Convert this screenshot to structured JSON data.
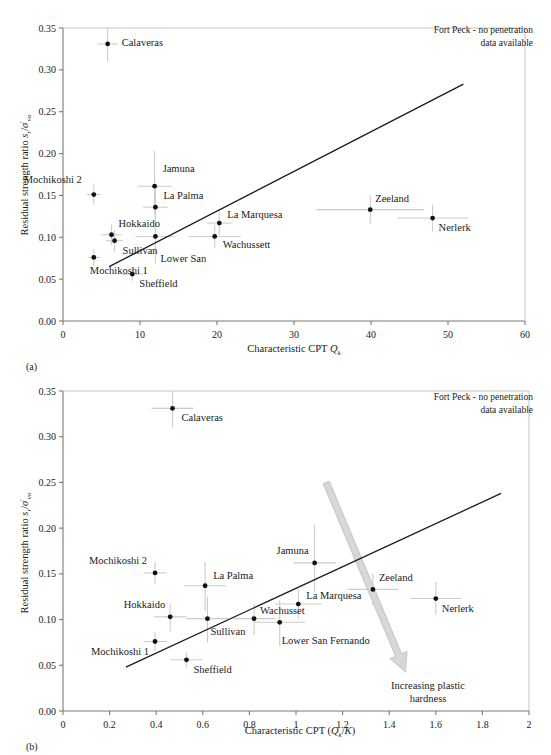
{
  "figure": {
    "panel_a_tag": "(a)",
    "panel_b_tag": "(b)",
    "note_line1": "Fort Peck - no penetration",
    "note_line2": "data available",
    "arrow_note_line1": "Increasing plastic",
    "arrow_note_line2": "hardness",
    "line_color": "#1a1a1a",
    "point_color": "#111111",
    "errorbar_color": "#cccccc",
    "axis_color": "#7a7a7a",
    "arrow_color": "#d8d8d8"
  },
  "chart_data": [
    {
      "type": "scatter",
      "panel": "(a)",
      "title": "",
      "xlabel": "Characteristic CPT Q_k",
      "xlabel_main": "Characteristic CPT ",
      "xlabel_sym": "Q",
      "xlabel_sub": "k",
      "ylabel": "Residual strength ratio s_r/σ'_vo",
      "ylabel_pre": "Residual strength ratio ",
      "ylabel_s": "s",
      "ylabel_s_sub": "r",
      "ylabel_slash": "/",
      "ylabel_sigma": "σ",
      "ylabel_sigma_sub": "vo",
      "xlim": [
        0,
        60
      ],
      "ylim": [
        0.0,
        0.35
      ],
      "xticks": [
        "0",
        "10",
        "20",
        "30",
        "40",
        "50",
        "60"
      ],
      "xtick_values": [
        0,
        10,
        20,
        30,
        40,
        50,
        60
      ],
      "yticks": [
        "0.00",
        "0.05",
        "0.10",
        "0.15",
        "0.20",
        "0.25",
        "0.30",
        "0.35"
      ],
      "ytick_values": [
        0.0,
        0.05,
        0.1,
        0.15,
        0.2,
        0.25,
        0.3,
        0.35
      ],
      "grid": false,
      "legend": "none",
      "fit_line": {
        "x1": 6.0,
        "y1": 0.065,
        "x2": 52.0,
        "y2": 0.283
      },
      "points": [
        {
          "name": "Calaveras",
          "x": 5.8,
          "y": 0.331,
          "xerr_lo": 1.3,
          "xerr_hi": 1.3,
          "yerr_lo": 0.021,
          "yerr_hi": 0.019,
          "label_dx": 14,
          "label_dy": 2
        },
        {
          "name": "Mochikoshi 2",
          "x": 4.0,
          "y": 0.151,
          "xerr_lo": 0.9,
          "xerr_hi": 0.9,
          "yerr_lo": 0.012,
          "yerr_hi": 0.012,
          "label_dx": -12,
          "label_dy": -12,
          "anchor": "end"
        },
        {
          "name": "Jamuna",
          "x": 11.9,
          "y": 0.161,
          "xerr_lo": 2.2,
          "xerr_hi": 2.2,
          "yerr_lo": 0.033,
          "yerr_hi": 0.042,
          "label_dx": 8,
          "label_dy": -14
        },
        {
          "name": "La Palma",
          "x": 12.0,
          "y": 0.136,
          "xerr_lo": 1.6,
          "xerr_hi": 1.6,
          "yerr_lo": 0.028,
          "yerr_hi": 0.026,
          "label_dx": 8,
          "label_dy": -8
        },
        {
          "name": "Hokkaido",
          "x": 6.3,
          "y": 0.103,
          "xerr_lo": 1.3,
          "xerr_hi": 1.3,
          "yerr_lo": 0.012,
          "yerr_hi": 0.012,
          "label_dx": 7,
          "label_dy": -8
        },
        {
          "name": "Sullivan",
          "x": 6.7,
          "y": 0.096,
          "xerr_lo": 1.1,
          "xerr_hi": 1.1,
          "yerr_lo": 0.013,
          "yerr_hi": 0.013,
          "label_dx": 8,
          "label_dy": 13
        },
        {
          "name": "Lower San",
          "x": 12.0,
          "y": 0.101,
          "xerr_lo": 2.6,
          "xerr_hi": 2.6,
          "yerr_lo": 0.032,
          "yerr_hi": 0.038,
          "label_dx": 5,
          "label_dy": 26
        },
        {
          "name": "Mochikoshi 1",
          "x": 4.0,
          "y": 0.076,
          "xerr_lo": 0.8,
          "xerr_hi": 0.8,
          "yerr_lo": 0.01,
          "yerr_hi": 0.01,
          "label_dx": -4,
          "label_dy": 17,
          "anchor": "start"
        },
        {
          "name": "Sheffield",
          "x": 9.0,
          "y": 0.056,
          "xerr_lo": 1.3,
          "xerr_hi": 1.3,
          "yerr_lo": 0.008,
          "yerr_hi": 0.008,
          "label_dx": 7,
          "label_dy": 13
        },
        {
          "name": "La Marquesa",
          "x": 20.3,
          "y": 0.117,
          "xerr_lo": 1.6,
          "xerr_hi": 1.6,
          "yerr_lo": 0.014,
          "yerr_hi": 0.014,
          "label_dx": 8,
          "label_dy": -5
        },
        {
          "name": "Wachussett",
          "x": 19.7,
          "y": 0.101,
          "xerr_lo": 3.4,
          "xerr_hi": 3.4,
          "yerr_lo": 0.014,
          "yerr_hi": 0.014,
          "label_dx": 8,
          "label_dy": 12
        },
        {
          "name": "Zeeland",
          "x": 39.9,
          "y": 0.133,
          "xerr_lo": 7.0,
          "xerr_hi": 7.0,
          "yerr_lo": 0.017,
          "yerr_hi": 0.017,
          "label_dx": 5,
          "label_dy": -8
        },
        {
          "name": "Nerlerk",
          "x": 48.0,
          "y": 0.123,
          "xerr_lo": 4.6,
          "xerr_hi": 4.6,
          "yerr_lo": 0.016,
          "yerr_hi": 0.016,
          "label_dx": 6,
          "label_dy": 13
        }
      ]
    },
    {
      "type": "scatter",
      "panel": "(b)",
      "title": "",
      "xlabel": "Characteristic CPT (Q_k/K)",
      "xlabel_main": "Characteristic CPT (",
      "xlabel_sym": "Q",
      "xlabel_sub": "k",
      "xlabel_mid": "/",
      "xlabel_sym2": "K",
      "xlabel_end": ")",
      "ylabel": "Residual strength ratio s_r/σ'_vo",
      "ylabel_pre": "Residual strength ratio ",
      "ylabel_s": "s",
      "ylabel_s_sub": "r",
      "ylabel_slash": "/",
      "ylabel_sigma": "σ",
      "ylabel_sigma_sub": "vo",
      "xlim": [
        0,
        2
      ],
      "ylim": [
        0.0,
        0.35
      ],
      "xticks": [
        "0",
        "0.2",
        "0.4",
        "0.6",
        "0.8",
        "1",
        "1.2",
        "1.4",
        "1.6",
        "1.8",
        "2"
      ],
      "xtick_values": [
        0,
        0.2,
        0.4,
        0.6,
        0.8,
        1.0,
        1.2,
        1.4,
        1.6,
        1.8,
        2.0
      ],
      "yticks": [
        "0.00",
        "0.05",
        "0.10",
        "0.15",
        "0.20",
        "0.25",
        "0.30",
        "0.35"
      ],
      "ytick_values": [
        0.0,
        0.05,
        0.1,
        0.15,
        0.2,
        0.25,
        0.3,
        0.35
      ],
      "grid": false,
      "legend": "none",
      "fit_line": {
        "x1": 0.27,
        "y1": 0.048,
        "x2": 1.88,
        "y2": 0.238
      },
      "arrow": {
        "x1": 1.13,
        "y1": 0.25,
        "x2": 1.47,
        "y2": 0.043
      },
      "points": [
        {
          "name": "Calaveras",
          "x": 0.47,
          "y": 0.331,
          "xerr_lo": 0.09,
          "xerr_hi": 0.09,
          "yerr_lo": 0.021,
          "yerr_hi": 0.019,
          "label_dx": 9,
          "label_dy": 13
        },
        {
          "name": "Mochikoshi 2",
          "x": 0.395,
          "y": 0.151,
          "xerr_lo": 0.05,
          "xerr_hi": 0.05,
          "yerr_lo": 0.012,
          "yerr_hi": 0.012,
          "label_dx": -8,
          "label_dy": -9,
          "anchor": "end"
        },
        {
          "name": "La Palma",
          "x": 0.61,
          "y": 0.137,
          "xerr_lo": 0.09,
          "xerr_hi": 0.09,
          "yerr_lo": 0.028,
          "yerr_hi": 0.026,
          "label_dx": 8,
          "label_dy": -7
        },
        {
          "name": "Hokkaido",
          "x": 0.46,
          "y": 0.103,
          "xerr_lo": 0.07,
          "xerr_hi": 0.07,
          "yerr_lo": 0.016,
          "yerr_hi": 0.014,
          "label_dx": -5,
          "label_dy": -9,
          "anchor": "end"
        },
        {
          "name": "Sullivan",
          "x": 0.62,
          "y": 0.101,
          "xerr_lo": 0.09,
          "xerr_hi": 0.09,
          "yerr_lo": 0.026,
          "yerr_hi": 0.024,
          "label_dx": 3,
          "label_dy": 16
        },
        {
          "name": "Mochikoshi 1",
          "x": 0.395,
          "y": 0.076,
          "xerr_lo": 0.05,
          "xerr_hi": 0.05,
          "yerr_lo": 0.01,
          "yerr_hi": 0.01,
          "label_dx": -6,
          "label_dy": 13,
          "anchor": "end"
        },
        {
          "name": "Sheffield",
          "x": 0.53,
          "y": 0.056,
          "xerr_lo": 0.07,
          "xerr_hi": 0.07,
          "yerr_lo": 0.008,
          "yerr_hi": 0.008,
          "label_dx": 7,
          "label_dy": 13
        },
        {
          "name": "Jamuna",
          "x": 1.08,
          "y": 0.162,
          "xerr_lo": 0.09,
          "xerr_hi": 0.09,
          "yerr_lo": 0.032,
          "yerr_hi": 0.042,
          "label_dx": -6,
          "label_dy": -9,
          "anchor": "end"
        },
        {
          "name": "Wachusset",
          "x": 0.82,
          "y": 0.101,
          "xerr_lo": 0.09,
          "xerr_hi": 0.09,
          "yerr_lo": 0.018,
          "yerr_hi": 0.016,
          "label_dx": 6,
          "label_dy": -5
        },
        {
          "name": "Lower San Fernando",
          "x": 0.93,
          "y": 0.097,
          "xerr_lo": 0.11,
          "xerr_hi": 0.11,
          "yerr_lo": 0.026,
          "yerr_hi": 0.024,
          "label_dx": 2,
          "label_dy": 22
        },
        {
          "name": "La Marquesa",
          "x": 1.01,
          "y": 0.117,
          "xerr_lo": 0.1,
          "xerr_hi": 0.1,
          "yerr_lo": 0.016,
          "yerr_hi": 0.016,
          "label_dx": 8,
          "label_dy": -5
        },
        {
          "name": "Zeeland",
          "x": 1.33,
          "y": 0.133,
          "xerr_lo": 0.11,
          "xerr_hi": 0.11,
          "yerr_lo": 0.017,
          "yerr_hi": 0.017,
          "label_dx": 6,
          "label_dy": -8
        },
        {
          "name": "Nerlerk",
          "x": 1.6,
          "y": 0.123,
          "xerr_lo": 0.11,
          "xerr_hi": 0.11,
          "yerr_lo": 0.018,
          "yerr_hi": 0.018,
          "label_dx": 6,
          "label_dy": 13
        }
      ]
    }
  ]
}
